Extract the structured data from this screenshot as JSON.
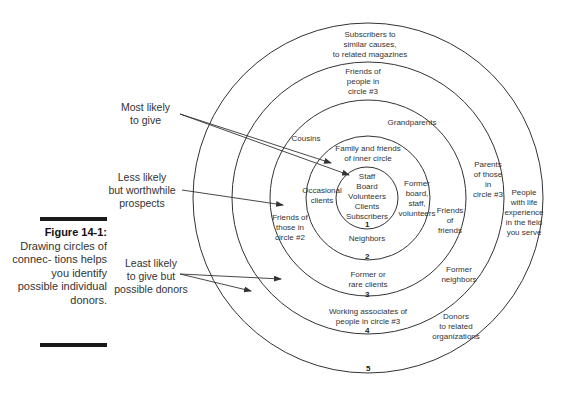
{
  "figure": {
    "label": "Figure 14-1:",
    "caption": "Drawing circles of connec- tions helps you identify possible individual donors."
  },
  "callouts": {
    "most_likely": "Most likely\nto give",
    "less_likely": "Less likely\nbut worthwhile\nprospects",
    "least_likely": "Least likely\nto give but\npossible donors"
  },
  "circles": [
    {
      "number": "1",
      "items": "Staff\nBoard\nVolunteers\nClients\nSubscribers"
    },
    {
      "number": "2",
      "items": [
        "Family and friends\nof inner circle",
        "Occasional\nclients",
        "Former\nboard,\nstaff,\nvolunteers",
        "Neighbors"
      ]
    },
    {
      "number": "3",
      "items": [
        "Cousins",
        "Grandparents",
        "Friends of\nthose in\ncircle #2",
        "Friends\nof\nfriends",
        "Former or\nrare clients"
      ]
    },
    {
      "number": "4",
      "items": [
        "Friends of\npeople in\ncircle #3",
        "Parents\nof those\nin\ncircle #3",
        "Former\nneighbors",
        "Working associates of\npeople in circle #3"
      ]
    },
    {
      "number": "5",
      "items": [
        "Subscribers to\nsimilar causes,\nto related magazines",
        "People\nwith life\nexperience\nin the field\nyou serve",
        "Donors\nto related\norganizations"
      ]
    }
  ],
  "colors": {
    "line": "#333333",
    "text": "#333333",
    "bar": "#1a1a1a"
  }
}
